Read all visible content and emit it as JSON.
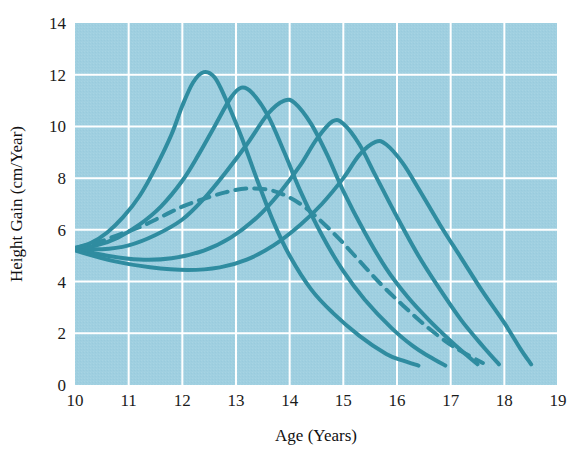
{
  "chart_data": {
    "type": "line",
    "title": "",
    "xlabel": "Age (Years)",
    "ylabel": "Height Gain (cm/Year)",
    "xlim": [
      10,
      19
    ],
    "ylim": [
      0,
      14
    ],
    "xticks": [
      "10",
      "11",
      "12",
      "13",
      "14",
      "15",
      "16",
      "17",
      "18",
      "19"
    ],
    "yticks": [
      "0",
      "2",
      "4",
      "6",
      "8",
      "10",
      "12",
      "14"
    ],
    "grid": true,
    "legend": "none",
    "plot_background": "#9fcfe0",
    "line_color": "#2f8ca0",
    "gridline_color": "#ffffff",
    "series": [
      {
        "name": "Early maturer 1",
        "style": "solid",
        "peak_age": 12.4,
        "peak_value": 12.1,
        "start_value": 5.3,
        "end_age": 16.4,
        "end_value": 0.75,
        "points": [
          [
            10.0,
            5.3
          ],
          [
            10.3,
            5.5
          ],
          [
            10.6,
            5.9
          ],
          [
            10.9,
            6.5
          ],
          [
            11.2,
            7.3
          ],
          [
            11.5,
            8.4
          ],
          [
            11.8,
            9.7
          ],
          [
            12.0,
            10.8
          ],
          [
            12.2,
            11.7
          ],
          [
            12.4,
            12.1
          ],
          [
            12.6,
            11.9
          ],
          [
            12.8,
            11.1
          ],
          [
            13.1,
            9.6
          ],
          [
            13.4,
            7.9
          ],
          [
            13.7,
            6.3
          ],
          [
            14.0,
            5.0
          ],
          [
            14.4,
            3.7
          ],
          [
            14.8,
            2.8
          ],
          [
            15.3,
            1.9
          ],
          [
            15.8,
            1.2
          ],
          [
            16.1,
            0.95
          ],
          [
            16.4,
            0.75
          ]
        ]
      },
      {
        "name": "Early maturer 2",
        "style": "solid",
        "peak_age": 13.1,
        "peak_value": 11.5,
        "start_value": 5.3,
        "end_age": 16.9,
        "end_value": 0.75,
        "points": [
          [
            10.0,
            5.3
          ],
          [
            10.4,
            5.4
          ],
          [
            10.8,
            5.7
          ],
          [
            11.2,
            6.2
          ],
          [
            11.6,
            6.9
          ],
          [
            12.0,
            7.9
          ],
          [
            12.3,
            8.9
          ],
          [
            12.6,
            10.0
          ],
          [
            12.9,
            11.1
          ],
          [
            13.1,
            11.5
          ],
          [
            13.3,
            11.3
          ],
          [
            13.6,
            10.4
          ],
          [
            13.9,
            9.0
          ],
          [
            14.2,
            7.5
          ],
          [
            14.6,
            5.8
          ],
          [
            15.0,
            4.4
          ],
          [
            15.4,
            3.3
          ],
          [
            15.9,
            2.2
          ],
          [
            16.3,
            1.5
          ],
          [
            16.6,
            1.1
          ],
          [
            16.9,
            0.75
          ]
        ]
      },
      {
        "name": "Average maturer",
        "style": "solid",
        "peak_age": 13.9,
        "peak_value": 11.0,
        "start_value": 5.3,
        "end_age": 17.5,
        "end_value": 0.8,
        "points": [
          [
            10.0,
            5.3
          ],
          [
            10.5,
            5.25
          ],
          [
            11.0,
            5.4
          ],
          [
            11.5,
            5.8
          ],
          [
            12.0,
            6.4
          ],
          [
            12.4,
            7.2
          ],
          [
            12.8,
            8.2
          ],
          [
            13.2,
            9.3
          ],
          [
            13.6,
            10.5
          ],
          [
            13.9,
            11.0
          ],
          [
            14.1,
            10.9
          ],
          [
            14.4,
            10.1
          ],
          [
            14.7,
            8.9
          ],
          [
            15.0,
            7.5
          ],
          [
            15.4,
            5.9
          ],
          [
            15.8,
            4.5
          ],
          [
            16.2,
            3.4
          ],
          [
            16.6,
            2.5
          ],
          [
            17.0,
            1.7
          ],
          [
            17.3,
            1.15
          ],
          [
            17.5,
            0.8
          ]
        ]
      },
      {
        "name": "Late maturer 1",
        "style": "solid",
        "peak_age": 14.8,
        "peak_value": 10.2,
        "start_value": 5.25,
        "end_age": 17.9,
        "end_value": 0.8,
        "points": [
          [
            10.0,
            5.25
          ],
          [
            10.6,
            5.0
          ],
          [
            11.2,
            4.85
          ],
          [
            11.8,
            4.9
          ],
          [
            12.4,
            5.2
          ],
          [
            12.9,
            5.7
          ],
          [
            13.4,
            6.5
          ],
          [
            13.8,
            7.4
          ],
          [
            14.2,
            8.5
          ],
          [
            14.5,
            9.5
          ],
          [
            14.8,
            10.2
          ],
          [
            15.0,
            10.1
          ],
          [
            15.3,
            9.3
          ],
          [
            15.6,
            8.1
          ],
          [
            16.0,
            6.5
          ],
          [
            16.4,
            5.0
          ],
          [
            16.8,
            3.7
          ],
          [
            17.2,
            2.5
          ],
          [
            17.6,
            1.5
          ],
          [
            17.9,
            0.8
          ]
        ]
      },
      {
        "name": "Late maturer 2",
        "style": "solid",
        "peak_age": 15.6,
        "peak_value": 9.4,
        "start_value": 5.2,
        "end_age": 18.5,
        "end_value": 0.8,
        "points": [
          [
            10.0,
            5.2
          ],
          [
            10.7,
            4.8
          ],
          [
            11.4,
            4.55
          ],
          [
            12.1,
            4.45
          ],
          [
            12.7,
            4.55
          ],
          [
            13.2,
            4.85
          ],
          [
            13.7,
            5.4
          ],
          [
            14.2,
            6.2
          ],
          [
            14.6,
            7.0
          ],
          [
            15.0,
            8.0
          ],
          [
            15.3,
            8.9
          ],
          [
            15.6,
            9.4
          ],
          [
            15.8,
            9.3
          ],
          [
            16.1,
            8.6
          ],
          [
            16.4,
            7.6
          ],
          [
            16.8,
            6.2
          ],
          [
            17.2,
            4.9
          ],
          [
            17.6,
            3.6
          ],
          [
            18.0,
            2.4
          ],
          [
            18.3,
            1.4
          ],
          [
            18.5,
            0.8
          ]
        ]
      },
      {
        "name": "Mean curve",
        "style": "dashed",
        "peak_age": 13.2,
        "peak_value": 7.6,
        "start_value": 5.3,
        "end_age": 17.6,
        "end_value": 0.85,
        "points": [
          [
            10.0,
            5.3
          ],
          [
            10.4,
            5.5
          ],
          [
            10.8,
            5.8
          ],
          [
            11.2,
            6.1
          ],
          [
            11.6,
            6.5
          ],
          [
            12.0,
            6.9
          ],
          [
            12.4,
            7.2
          ],
          [
            12.8,
            7.45
          ],
          [
            13.2,
            7.6
          ],
          [
            13.6,
            7.55
          ],
          [
            13.9,
            7.35
          ],
          [
            14.2,
            7.0
          ],
          [
            14.5,
            6.5
          ],
          [
            14.9,
            5.7
          ],
          [
            15.3,
            4.8
          ],
          [
            15.7,
            3.9
          ],
          [
            16.1,
            3.1
          ],
          [
            16.5,
            2.35
          ],
          [
            16.9,
            1.7
          ],
          [
            17.2,
            1.3
          ],
          [
            17.6,
            0.85
          ]
        ]
      }
    ]
  },
  "figure": {
    "xlabel": "Age (Years)",
    "ylabel": "Height Gain (cm/Year)"
  }
}
